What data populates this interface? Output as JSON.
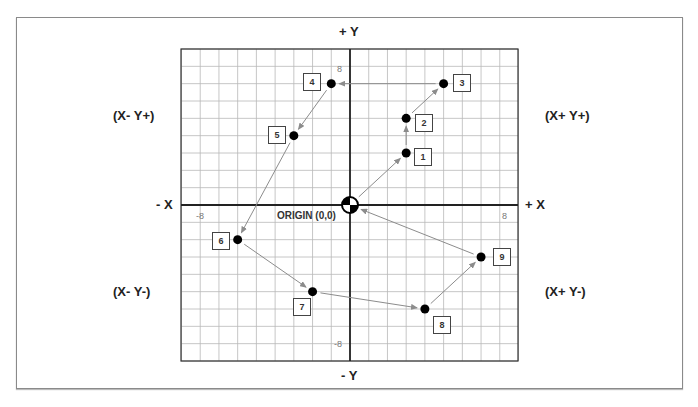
{
  "diagram": {
    "axes": {
      "plus_y": "+ Y",
      "minus_y": "- Y",
      "plus_x": "+ X",
      "minus_x": "- X"
    },
    "quadrants": {
      "q1": "(X+ Y+)",
      "q2": "(X- Y+)",
      "q3": "(X- Y-)",
      "q4": "(X+ Y-)"
    },
    "ticks": {
      "x_neg": "-8",
      "x_pos": "8",
      "y_pos": "8",
      "y_neg": "-8"
    },
    "origin_label": "ORIGIN (0,0)",
    "grid": {
      "x_range": [
        -9,
        9
      ],
      "y_range": [
        -9,
        9
      ],
      "step": 1
    },
    "colors": {
      "grid": "#b8b8b8",
      "axis": "#222222",
      "arrow": "#8c8c8c",
      "point": "#000000"
    },
    "points": [
      {
        "label": "1",
        "x": 3,
        "y": 3
      },
      {
        "label": "2",
        "x": 3,
        "y": 5
      },
      {
        "label": "3",
        "x": 5,
        "y": 7
      },
      {
        "label": "4",
        "x": -1,
        "y": 7
      },
      {
        "label": "5",
        "x": -3,
        "y": 4
      },
      {
        "label": "6",
        "x": -6,
        "y": -2
      },
      {
        "label": "7",
        "x": -2,
        "y": -5
      },
      {
        "label": "8",
        "x": 4,
        "y": -6
      },
      {
        "label": "9",
        "x": 7,
        "y": -3
      }
    ],
    "path_order": [
      "origin",
      "1",
      "2",
      "3",
      "4",
      "5",
      "6",
      "7",
      "8",
      "9",
      "origin"
    ]
  }
}
